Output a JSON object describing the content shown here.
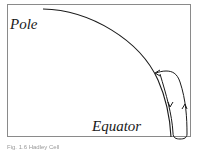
{
  "diagram": {
    "type": "atmospheric-circulation-cell",
    "labels": {
      "pole": "Pole",
      "equator": "Equator"
    },
    "elements": {
      "surface_arc": "curved Earth surface from pole to equator",
      "circulation_loop": "closed convection cell near equator with arrows: rising on outer side, flowing poleward at top, sinking/returning along surface"
    },
    "colors": {
      "line": "#1a1a1a",
      "frame": "#8a8a8a",
      "background": "#ffffff",
      "caption": "#9a9a9a"
    }
  },
  "caption": {
    "text": "Fig. 1.6 Hadley Cell"
  }
}
